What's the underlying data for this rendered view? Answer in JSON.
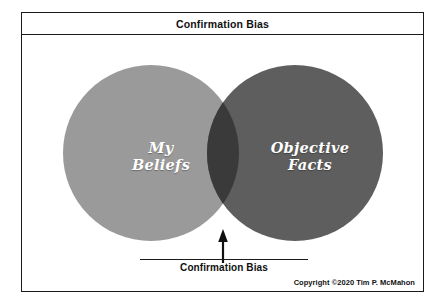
{
  "diagram": {
    "title": "Confirmation Bias",
    "left_circle": {
      "label": "My\nBeliefs",
      "color": "#9a9a9a"
    },
    "right_circle": {
      "label": "Objective\nFacts",
      "color": "#5e5e5e"
    },
    "overlap": {
      "label": "Confirmation Bias",
      "color": "#3a3a3a"
    },
    "annotation": {
      "arrow": "up-arrow-icon",
      "caption": "Confirmation Bias"
    },
    "copyright": "Copyright ©2020 Tim P. McMahon",
    "background": "#ffffff",
    "border_color": "#1a1a1a"
  }
}
